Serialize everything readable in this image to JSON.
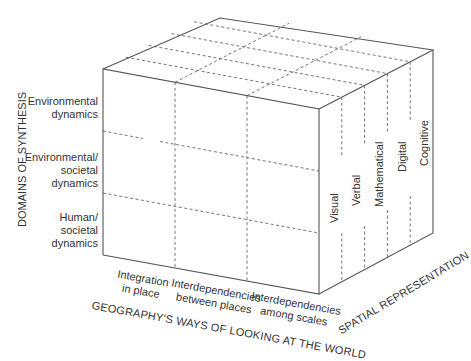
{
  "diagram": {
    "type": "3d-cube-matrix",
    "axes": {
      "vertical": {
        "title": "DOMAINS OF SYNTHESIS",
        "levels": [
          "Environmental dynamics",
          "Environmental/ societal dynamics",
          "Human/ societal dynamics"
        ]
      },
      "horizontal": {
        "title": "GEOGRAPHY'S WAYS OF LOOKING AT THE WORLD",
        "levels": [
          "Integration in place",
          "Interdependencies between places",
          "Interdependencies among scales"
        ]
      },
      "depth": {
        "title": "SPATIAL REPRESENTATION",
        "levels": [
          "Visual",
          "Verbal",
          "Mathematical",
          "Digital",
          "Cognitive"
        ]
      }
    }
  },
  "labels": {
    "vertical_title": "DOMAINS OF SYNTHESIS",
    "row1_line1": "Environmental",
    "row1_line2": "dynamics",
    "row2_line1": "Environmental/",
    "row2_line2": "societal",
    "row2_line3": "dynamics",
    "row3_line1": "Human/",
    "row3_line2": "societal",
    "row3_line3": "dynamics",
    "col1_line1": "Integration",
    "col1_line2": "in place",
    "col2_line1": "Interdependencies",
    "col2_line2": "between places",
    "col3_line1": "Interdependencies",
    "col3_line2": "among scales",
    "horizontal_title": "GEOGRAPHY'S WAYS OF LOOKING AT THE WORLD",
    "depth_title": "SPATIAL REPRESENTATION",
    "depth1": "Visual",
    "depth2": "Verbal",
    "depth3": "Mathematical",
    "depth4": "Digital",
    "depth5": "Cognitive"
  }
}
